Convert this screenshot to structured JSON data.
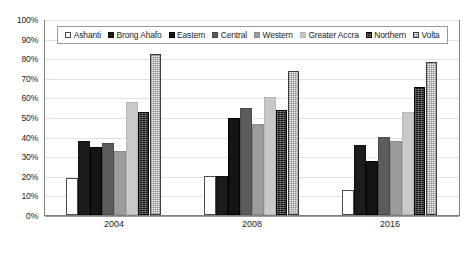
{
  "chart_data": {
    "type": "bar",
    "title": "",
    "subtitle": "",
    "xlabel": "",
    "ylabel": "",
    "categories": [
      "2004",
      "2008",
      "2016"
    ],
    "ylim": [
      0,
      100
    ],
    "ytick_labels": [
      "0%",
      "10%",
      "20%",
      "30%",
      "40%",
      "50%",
      "60%",
      "70%",
      "80%",
      "90%",
      "100%"
    ],
    "ytick_values": [
      0,
      10,
      20,
      30,
      40,
      50,
      60,
      70,
      80,
      90,
      100
    ],
    "grid": true,
    "legend_position": "top-inside",
    "value_suffix": "%",
    "series": [
      {
        "name": "Ashanti",
        "key": "ashanti",
        "values": [
          19,
          20,
          13
        ]
      },
      {
        "name": "Brong Ahafo",
        "key": "brong",
        "values": [
          38,
          20,
          36
        ]
      },
      {
        "name": "Eastern",
        "key": "eastern",
        "values": [
          35,
          50,
          28
        ]
      },
      {
        "name": "Central",
        "key": "central",
        "values": [
          37,
          55,
          40
        ]
      },
      {
        "name": "Western",
        "key": "western",
        "values": [
          33,
          47,
          38
        ]
      },
      {
        "name": "Greater Accra",
        "key": "accra",
        "values": [
          58,
          61,
          53
        ]
      },
      {
        "name": "Northern",
        "key": "northern",
        "values": [
          53,
          54,
          66
        ]
      },
      {
        "name": "Volta",
        "key": "volta",
        "values": [
          83,
          74,
          79
        ]
      }
    ]
  },
  "colors": {
    "ashanti": "#ffffff",
    "brong": "#1c1c1c",
    "eastern": "#141414",
    "central": "#5c5c5c",
    "western": "#9c9c9c",
    "accra": "#c9c9c9",
    "northern": "#151515",
    "volta": "#f2f2f2",
    "gridline": "#e2e2e2",
    "axis": "#808080"
  }
}
